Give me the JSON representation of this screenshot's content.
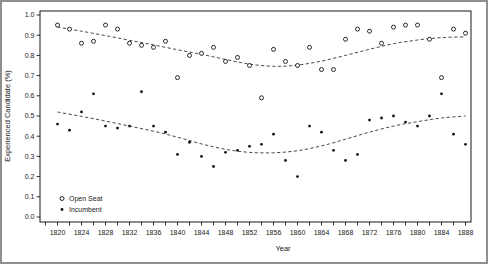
{
  "figure": {
    "background": "#ffffff",
    "frame_color": "#8f8f8f",
    "axis_color": "#000000",
    "text_color": "#1a1a1a",
    "marker_color": "#111111",
    "trend_color": "#333333"
  },
  "chart_data": {
    "type": "scatter",
    "title": "",
    "xlabel": "Year",
    "ylabel": "Experienced Candidate (%)",
    "xlim": [
      1817,
      1890
    ],
    "ylim": [
      0.0,
      1.0
    ],
    "grid": false,
    "x_major_tick_labels": [
      "1820",
      "1824",
      "1828",
      "1832",
      "1836",
      "1840",
      "1844",
      "1848",
      "1852",
      "1856",
      "1860",
      "1864",
      "1868",
      "1872",
      "1876",
      "1880",
      "1884",
      "1888"
    ],
    "x_major_tick_years": [
      1820,
      1824,
      1828,
      1832,
      1836,
      1840,
      1844,
      1848,
      1852,
      1856,
      1860,
      1864,
      1868,
      1872,
      1876,
      1880,
      1884,
      1888
    ],
    "x_minor_tick_step": 2,
    "y_tick_labels": [
      "0.0",
      "0.1",
      "0.2",
      "0.3",
      "0.4",
      "0.5",
      "0.6",
      "0.7",
      "0.8",
      "0.9",
      "1.0"
    ],
    "y_tick_values": [
      0.0,
      0.1,
      0.2,
      0.3,
      0.4,
      0.5,
      0.6,
      0.7,
      0.8,
      0.9,
      1.0
    ],
    "legend": {
      "position": "bottom-left",
      "entries": [
        {
          "label": "Open Seat",
          "marker": "open-circle"
        },
        {
          "label": "Incumbent",
          "marker": "filled-circle"
        }
      ]
    },
    "x": [
      1820,
      1822,
      1824,
      1826,
      1828,
      1830,
      1832,
      1834,
      1836,
      1838,
      1840,
      1842,
      1844,
      1846,
      1848,
      1850,
      1852,
      1854,
      1856,
      1858,
      1860,
      1862,
      1864,
      1866,
      1868,
      1870,
      1872,
      1874,
      1876,
      1878,
      1880,
      1882,
      1884,
      1886,
      1888
    ],
    "series": [
      {
        "name": "Open Seat",
        "marker": "open-circle",
        "values": [
          0.95,
          0.93,
          0.86,
          0.87,
          0.95,
          0.93,
          0.86,
          0.85,
          0.84,
          0.87,
          0.69,
          0.8,
          0.81,
          0.84,
          0.77,
          0.79,
          0.75,
          0.59,
          0.83,
          0.77,
          0.75,
          0.84,
          0.73,
          0.73,
          0.88,
          0.93,
          0.92,
          0.86,
          0.94,
          0.95,
          0.95,
          0.88,
          0.69,
          0.93,
          0.91
        ],
        "trend_style": "dashed",
        "trend_x": [
          1820,
          1824,
          1828,
          1832,
          1836,
          1840,
          1844,
          1848,
          1852,
          1856,
          1860,
          1864,
          1868,
          1872,
          1876,
          1880,
          1884,
          1888
        ],
        "trend_values": [
          0.94,
          0.92,
          0.898,
          0.875,
          0.852,
          0.828,
          0.805,
          0.78,
          0.757,
          0.746,
          0.752,
          0.772,
          0.8,
          0.83,
          0.858,
          0.876,
          0.888,
          0.892
        ]
      },
      {
        "name": "Incumbent",
        "marker": "filled-circle",
        "values": [
          0.46,
          0.43,
          0.52,
          0.61,
          0.45,
          0.44,
          0.45,
          0.62,
          0.45,
          0.42,
          0.31,
          0.37,
          0.3,
          0.25,
          0.32,
          0.33,
          0.35,
          0.36,
          0.41,
          0.28,
          0.2,
          0.45,
          0.42,
          0.33,
          0.28,
          0.31,
          0.48,
          0.49,
          0.5,
          0.47,
          0.45,
          0.5,
          0.61,
          0.41,
          0.36
        ],
        "trend_style": "dashed",
        "trend_x": [
          1820,
          1824,
          1828,
          1832,
          1836,
          1840,
          1844,
          1848,
          1852,
          1856,
          1860,
          1864,
          1868,
          1872,
          1876,
          1880,
          1884,
          1888
        ],
        "trend_values": [
          0.52,
          0.498,
          0.475,
          0.45,
          0.425,
          0.395,
          0.362,
          0.335,
          0.32,
          0.318,
          0.328,
          0.352,
          0.385,
          0.42,
          0.45,
          0.472,
          0.49,
          0.5
        ]
      }
    ]
  }
}
